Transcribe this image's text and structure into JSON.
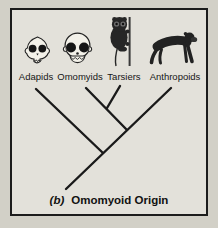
{
  "figure": {
    "caption": {
      "prefix": "(b)",
      "title": "Omomyoid Origin"
    }
  },
  "taxa": [
    {
      "label": "Adapids",
      "icon": "adapid-skull-icon"
    },
    {
      "label": "Omomyids",
      "icon": "omomyid-skull-icon"
    },
    {
      "label": "Tarsiers",
      "icon": "tarsier-icon"
    },
    {
      "label": "Anthropoids",
      "icon": "anthropoid-icon"
    }
  ],
  "tree": {
    "type": "cladogram",
    "newick": "(Adapids,((Omomyids,Tarsiers),Anthropoids))",
    "clades": [
      [
        "Omomyids",
        "Tarsiers"
      ],
      [
        "Omomyids",
        "Tarsiers",
        "Anthropoids"
      ],
      [
        "Adapids",
        "Omomyids",
        "Tarsiers",
        "Anthropoids"
      ]
    ]
  },
  "colors": {
    "outer_background": "#d2d0c7",
    "panel_background": "#e3e1da",
    "border": "#1c1c1c",
    "branch_line": "#1a1a1a"
  }
}
